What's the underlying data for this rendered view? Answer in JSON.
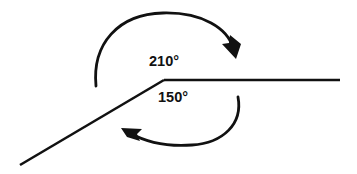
{
  "figure": {
    "background_color": "#ffffff",
    "stroke_color": "#111111",
    "text_color": "#111111"
  },
  "labels": {
    "upper_angle": "210°",
    "lower_angle": "150°"
  },
  "geometry": {
    "vertex": {
      "x": 164,
      "y": 80
    },
    "horizontal_ray": {
      "name": "horizontal-ray",
      "from": {
        "x": 164,
        "y": 80
      },
      "to": {
        "x": 340,
        "y": 80
      },
      "stroke_width": 2.6
    },
    "slanted_ray": {
      "name": "slanted-ray",
      "from": {
        "x": 164,
        "y": 80
      },
      "to": {
        "x": 20,
        "y": 165
      },
      "stroke_width": 2.6
    },
    "upper_arc": {
      "name": "upper-arc-210",
      "path": "M 96,86 C 92,44 118,14 163,13 C 203,12 228,29 233,48",
      "stroke_width": 2.8,
      "arrow_tip": {
        "x": 236,
        "y": 59
      },
      "arrow_points": "236,59 222,44 229,43 230,35 241,44",
      "direction": "clockwise"
    },
    "lower_arc": {
      "name": "lower-arc-150",
      "path": "M 238,97 C 243,124 223,143 192,145 C 164,147 144,141 130,133",
      "stroke_width": 2.8,
      "arrow_tip": {
        "x": 121,
        "y": 128
      },
      "arrow_points": "121,128 142,129 137,134 140,141 127,137",
      "direction": "counterclockwise"
    },
    "label_positions": {
      "upper": {
        "x": 164,
        "y": 62
      },
      "lower": {
        "x": 173,
        "y": 98
      }
    }
  },
  "chart_data": {
    "type": "diagram",
    "angles": [
      {
        "label": "210°",
        "value": 210,
        "unit": "degrees",
        "kind": "reflex",
        "measured_region": "above",
        "arc_direction": "clockwise",
        "arrow_end": "right"
      },
      {
        "label": "150°",
        "value": 150,
        "unit": "degrees",
        "kind": "obtuse",
        "measured_region": "below",
        "arc_direction": "counterclockwise",
        "arrow_end": "left"
      }
    ],
    "sum_of_angles": 360,
    "rays": [
      {
        "name": "horizontal ray",
        "direction": "right",
        "angle_from_east": 0
      },
      {
        "name": "slanted ray",
        "direction": "down-left",
        "angle_from_east": 210
      }
    ]
  }
}
